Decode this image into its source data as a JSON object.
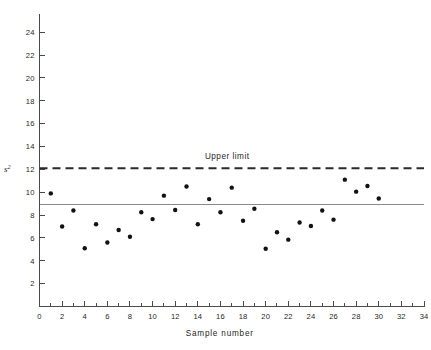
{
  "chart_data": {
    "type": "scatter",
    "title": "",
    "xlabel": "Sample number",
    "ylabel": "s2",
    "ylabel_base": "s",
    "ylabel_exponent": "2",
    "xlim": [
      0,
      34
    ],
    "ylim": [
      0,
      25.6
    ],
    "grid": false,
    "legend_position": "none",
    "x": [
      1,
      2,
      3,
      4,
      5,
      6,
      7,
      8,
      9,
      10,
      11,
      12,
      13,
      14,
      15,
      16,
      17,
      18,
      19,
      20,
      21,
      22,
      23,
      24,
      25,
      26,
      27,
      28,
      29,
      30
    ],
    "values": [
      9.9,
      7.0,
      8.4,
      5.1,
      7.2,
      5.6,
      6.7,
      6.1,
      8.25,
      7.65,
      9.7,
      8.45,
      10.5,
      7.2,
      9.4,
      8.25,
      10.4,
      7.5,
      8.55,
      5.05,
      6.5,
      5.85,
      7.35,
      7.05,
      8.4,
      7.6,
      11.1,
      10.05,
      10.55,
      9.45
    ],
    "series": [
      {
        "name": "Sample variance",
        "values": [
          9.9,
          7.0,
          8.4,
          5.1,
          7.2,
          5.6,
          6.7,
          6.1,
          8.25,
          7.65,
          9.7,
          8.45,
          10.5,
          7.2,
          9.4,
          8.25,
          10.4,
          7.5,
          8.55,
          5.05,
          6.5,
          5.85,
          7.35,
          7.05,
          8.4,
          7.6,
          11.1,
          10.05,
          10.55,
          9.45
        ]
      }
    ],
    "xticks": [
      0,
      2,
      4,
      6,
      8,
      10,
      12,
      14,
      16,
      18,
      20,
      22,
      24,
      26,
      28,
      30,
      32,
      34
    ],
    "xtick_labels": [
      "0",
      "2",
      "4",
      "6",
      "8",
      "10",
      "12",
      "14",
      "16",
      "18",
      "20",
      "22",
      "24",
      "26",
      "28",
      "30",
      "32",
      "34"
    ],
    "xminor_step": 1,
    "yticks": [
      2,
      4,
      6,
      8,
      10,
      12,
      14,
      16,
      18,
      20,
      22,
      24
    ],
    "ytick_labels": [
      "2",
      "4",
      "6",
      "8",
      "10",
      "12",
      "14",
      "16",
      "18",
      "20",
      "22",
      "24"
    ],
    "reference_lines": [
      {
        "name": "upper-limit",
        "label": "Upper limit",
        "value": 12.1,
        "style": "dashed",
        "color": "#2b2b2b"
      },
      {
        "name": "center-line",
        "label": "",
        "value": 8.9,
        "style": "solid",
        "color": "#8a8a8a"
      }
    ],
    "annotations": [
      {
        "name": "upper-limit-annotation",
        "text": "Upper limit",
        "x": 16.6,
        "y": 12.95
      }
    ],
    "colors": {
      "point": "#121212",
      "axis": "#4a4a4a",
      "limit": "#2b2b2b",
      "center": "#8a8a8a",
      "background": "#ffffff"
    }
  }
}
